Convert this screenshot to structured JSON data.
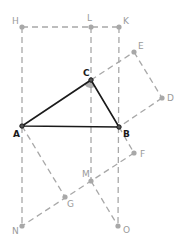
{
  "diagram": {
    "colors": {
      "main": "#1a1a1a",
      "construct": "#a8a8a8",
      "label_main": "#1a1a1a",
      "label_construct": "#9a9a9a",
      "angle_fill": "#9a9a9a"
    },
    "points": {
      "H": {
        "x": 22,
        "y": 27,
        "label": "H"
      },
      "L": {
        "x": 91,
        "y": 27,
        "label": "L"
      },
      "K": {
        "x": 119,
        "y": 27,
        "label": "K"
      },
      "E": {
        "x": 134,
        "y": 52,
        "label": "E"
      },
      "C": {
        "x": 91,
        "y": 80,
        "label": "C"
      },
      "D": {
        "x": 162,
        "y": 98,
        "label": "D"
      },
      "A": {
        "x": 22,
        "y": 126,
        "label": "A"
      },
      "B": {
        "x": 119,
        "y": 127,
        "label": "B"
      },
      "F": {
        "x": 134,
        "y": 153,
        "label": "F"
      },
      "M": {
        "x": 91,
        "y": 181,
        "label": "M"
      },
      "G": {
        "x": 65,
        "y": 197,
        "label": "G"
      },
      "N": {
        "x": 22,
        "y": 226,
        "label": "N"
      },
      "O": {
        "x": 118,
        "y": 226,
        "label": "O"
      }
    },
    "triangle": [
      "A",
      "B",
      "C"
    ],
    "construction_segments": [
      [
        "H",
        "K"
      ],
      [
        "H",
        "N"
      ],
      [
        "L",
        "M"
      ],
      [
        "K",
        "O"
      ],
      [
        "C",
        "E"
      ],
      [
        "E",
        "D"
      ],
      [
        "D",
        "B"
      ],
      [
        "A",
        "G"
      ],
      [
        "B",
        "F"
      ],
      [
        "F",
        "N"
      ],
      [
        "M",
        "O"
      ]
    ]
  }
}
